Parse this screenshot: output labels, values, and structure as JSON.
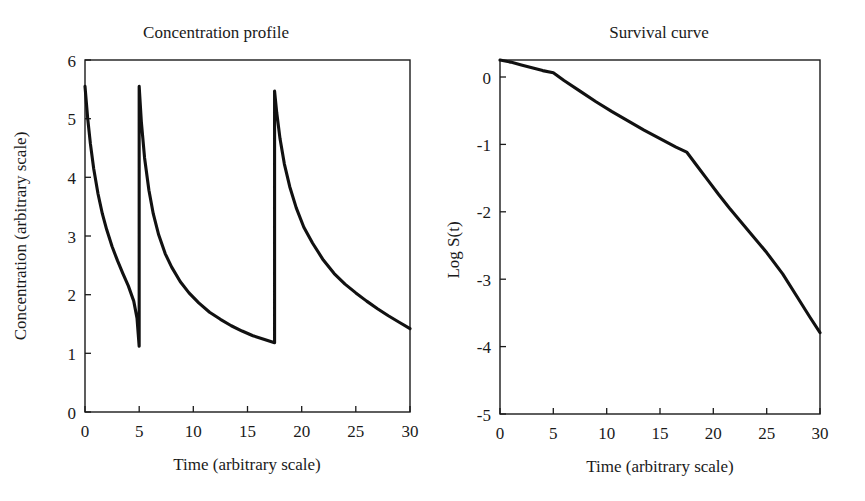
{
  "figure": {
    "background_color": "#ffffff",
    "line_color": "#111111",
    "text_color": "#1a1a1a"
  },
  "panels": {
    "left": {
      "title": "Concentration profile",
      "xlabel": "Time (arbitrary scale)",
      "ylabel": "Concentration (arbitrary scale)",
      "xticks": [
        "0",
        "5",
        "10",
        "15",
        "20",
        "25",
        "30"
      ],
      "yticks": [
        "0",
        "1",
        "2",
        "3",
        "4",
        "5",
        "6"
      ]
    },
    "right": {
      "title": "Survival curve",
      "xlabel": "Time (arbitrary scale)",
      "ylabel": "Log S(t)",
      "xticks": [
        "0",
        "5",
        "10",
        "15",
        "20",
        "25",
        "30"
      ],
      "yticks": [
        "-5",
        "-4",
        "-3",
        "-2",
        "-1",
        "0"
      ]
    }
  },
  "chart_data": [
    {
      "type": "line",
      "panel": "left",
      "title": "Concentration profile",
      "xlabel": "Time (arbitrary scale)",
      "ylabel": "Concentration (arbitrary scale)",
      "xlim": [
        0,
        30
      ],
      "ylim": [
        0,
        6
      ],
      "xticks": [
        0,
        5,
        10,
        15,
        20,
        25,
        30
      ],
      "yticks": [
        0,
        1,
        2,
        3,
        4,
        5,
        6
      ],
      "grid": false,
      "legend": "none",
      "description": "Saw-tooth multi-dose pharmacokinetic profile: three instantaneous dose spikes at t=0, t=5 and t=17.5, each followed by biexponential decay.",
      "dose_times": [
        0,
        5,
        17.5
      ],
      "peak_values": [
        5.55,
        5.55,
        5.47
      ],
      "trough_values": [
        1.12,
        1.18,
        1.42
      ],
      "series": [
        {
          "name": "Concentration",
          "x": [
            0,
            0.25,
            0.5,
            0.8,
            1.2,
            1.6,
            2,
            2.5,
            3,
            3.5,
            4,
            4.5,
            4.8,
            5,
            5,
            5.2,
            5.5,
            5.9,
            6.3,
            6.8,
            7.4,
            8,
            8.8,
            9.6,
            10.5,
            11.5,
            12.5,
            13.5,
            14.5,
            15.5,
            16.5,
            17.5,
            17.5,
            17.7,
            18,
            18.4,
            18.9,
            19.5,
            20.2,
            21,
            22,
            23,
            24,
            25,
            26,
            27,
            28,
            29,
            30
          ],
          "y": [
            5.55,
            5.0,
            4.57,
            4.15,
            3.72,
            3.38,
            3.11,
            2.82,
            2.58,
            2.36,
            2.15,
            1.89,
            1.6,
            1.12,
            5.55,
            4.95,
            4.33,
            3.78,
            3.38,
            3.02,
            2.7,
            2.47,
            2.22,
            2.03,
            1.86,
            1.7,
            1.58,
            1.47,
            1.38,
            1.3,
            1.24,
            1.18,
            5.47,
            5.1,
            4.66,
            4.23,
            3.84,
            3.48,
            3.15,
            2.88,
            2.59,
            2.36,
            2.18,
            2.03,
            1.89,
            1.76,
            1.64,
            1.53,
            1.42
          ]
        }
      ]
    },
    {
      "type": "line",
      "panel": "right",
      "title": "Survival curve",
      "xlabel": "Time (arbitrary scale)",
      "ylabel": "Log S(t)",
      "xlim": [
        0,
        30
      ],
      "ylim": [
        -5,
        0
      ],
      "xticks": [
        0,
        5,
        10,
        15,
        20,
        25,
        30
      ],
      "yticks": [
        -5,
        -4,
        -3,
        -2,
        -1,
        0
      ],
      "grid": false,
      "legend": "none",
      "description": "Log surviving fraction declining from 0 with slope breaks at t=5 and t=17.5, ending near -3.85 at t=30.",
      "breakpoints": [
        {
          "x": 0,
          "y": 0.0
        },
        {
          "x": 5,
          "y": -0.18
        },
        {
          "x": 17.5,
          "y": -1.3
        },
        {
          "x": 30,
          "y": -3.85
        }
      ],
      "series": [
        {
          "name": "Log S(t)",
          "x": [
            0,
            1,
            2,
            3,
            4,
            5,
            6,
            7.5,
            9,
            10.5,
            12,
            13.5,
            15,
            16.5,
            17.5,
            18.5,
            19.5,
            20.5,
            21.5,
            22.5,
            23.5,
            25,
            26.5,
            28,
            29,
            30
          ],
          "y": [
            0.0,
            -0.03,
            -0.07,
            -0.11,
            -0.15,
            -0.18,
            -0.29,
            -0.44,
            -0.59,
            -0.73,
            -0.86,
            -0.99,
            -1.11,
            -1.23,
            -1.3,
            -1.5,
            -1.7,
            -1.9,
            -2.09,
            -2.27,
            -2.45,
            -2.72,
            -3.02,
            -3.38,
            -3.62,
            -3.85
          ]
        }
      ]
    }
  ]
}
